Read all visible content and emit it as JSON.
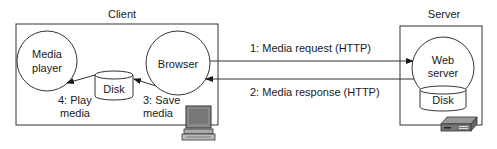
{
  "client": {
    "label": "Client",
    "media_player": {
      "line1": "Media",
      "line2": "player"
    },
    "browser": {
      "label": "Browser"
    },
    "disk": {
      "label": "Disk"
    },
    "step3": {
      "line1": "3: Save",
      "line2": "media"
    },
    "step4": {
      "line1": "4: Play",
      "line2": "media"
    },
    "device_icon": "desktop-computer-icon"
  },
  "server": {
    "label": "Server",
    "web_server": {
      "line1": "Web",
      "line2": "server"
    },
    "disk": {
      "label": "Disk"
    },
    "device_icon": "server-box-icon"
  },
  "arrows": {
    "request": "1: Media request (HTTP)",
    "response": "2: Media response (HTTP)"
  },
  "colors": {
    "line": "#1a1a1a",
    "background": "#ffffff"
  }
}
